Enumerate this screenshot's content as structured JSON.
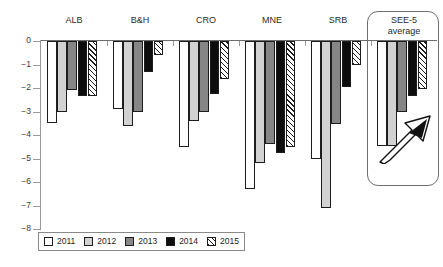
{
  "chart_data": {
    "type": "bar",
    "title": "",
    "subtitle": "",
    "xlabel": "",
    "ylabel": "",
    "ylim": [
      -8,
      0
    ],
    "grid": false,
    "legend_position": "bottom-left",
    "categories": [
      "ALB",
      "B&H",
      "CRO",
      "MNE",
      "SRB",
      "SEE-5\naverage"
    ],
    "y_ticks": [
      0,
      -1,
      -2,
      -3,
      -4,
      -5,
      -6,
      -7,
      -8
    ],
    "y_tick_labels": [
      "0",
      "−1",
      "−2",
      "−3",
      "−4",
      "−5",
      "−6",
      "−7",
      "−8"
    ],
    "series": [
      {
        "name": "2011",
        "color": "#ffffff",
        "fill": "solid",
        "values": [
          -3.5,
          -2.9,
          -4.5,
          -6.3,
          -5.0,
          -4.45
        ]
      },
      {
        "name": "2012",
        "color": "#d2d2d2",
        "fill": "solid",
        "values": [
          -3.0,
          -3.6,
          -3.4,
          -5.2,
          -7.1,
          -4.45
        ]
      },
      {
        "name": "2013",
        "color": "#868686",
        "fill": "solid",
        "values": [
          -2.1,
          -3.0,
          -3.0,
          -4.4,
          -3.55,
          -3.0
        ]
      },
      {
        "name": "2014",
        "color": "#0d0d0d",
        "fill": "solid",
        "values": [
          -2.35,
          -1.3,
          -2.25,
          -4.75,
          -1.95,
          -2.35
        ]
      },
      {
        "name": "2015",
        "color": "#ffffff",
        "fill": "hatched",
        "values": [
          -2.35,
          -0.6,
          -1.6,
          -4.5,
          -1.0,
          -2.05
        ]
      }
    ],
    "annotations": [
      {
        "name": "see5-highlight-box",
        "shape": "rounded-rectangle",
        "target": "SEE-5 average"
      },
      {
        "name": "improvement-arrow",
        "shape": "arrow",
        "direction": "up-right"
      }
    ]
  },
  "legend": {
    "items": [
      {
        "label": "2011"
      },
      {
        "label": "2012"
      },
      {
        "label": "2013"
      },
      {
        "label": "2014"
      },
      {
        "label": "2015"
      }
    ]
  }
}
